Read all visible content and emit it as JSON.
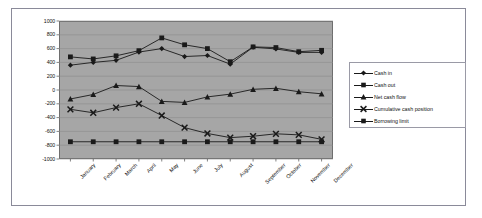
{
  "chart_data": {
    "type": "line",
    "title": "",
    "xlabel": "",
    "ylabel": "",
    "ylim": [
      -1000,
      1000
    ],
    "grid": true,
    "legend_position": "right",
    "plot_background": "#a6a6a6",
    "categories": [
      "January",
      "February",
      "March",
      "April",
      "May",
      "June",
      "July",
      "August",
      "September",
      "October",
      "November",
      "December"
    ],
    "yticks": [
      1000,
      800,
      600,
      400,
      200,
      0,
      -200,
      -400,
      -600,
      -800,
      -1000
    ],
    "series": [
      {
        "name": "Cash in",
        "marker": "diamond",
        "color": "#1a1a1a",
        "values": [
          360,
          400,
          430,
          550,
          600,
          485,
          500,
          375,
          620,
          595,
          545,
          545
        ]
      },
      {
        "name": "Cash out",
        "marker": "square",
        "color": "#1a1a1a",
        "values": [
          480,
          450,
          495,
          570,
          755,
          655,
          600,
          410,
          625,
          615,
          555,
          575
        ]
      },
      {
        "name": "Net cash flow",
        "marker": "triangle",
        "color": "#1a1a1a",
        "values": [
          -130,
          -65,
          65,
          50,
          -165,
          -180,
          -100,
          -60,
          10,
          25,
          -25,
          -55
        ]
      },
      {
        "name": "Cumulative cash position",
        "marker": "cross",
        "color": "#1a1a1a",
        "values": [
          -280,
          -330,
          -255,
          -200,
          -370,
          -545,
          -630,
          -690,
          -670,
          -635,
          -650,
          -715
        ]
      },
      {
        "name": "Borrowing limit",
        "marker": "square",
        "color": "#1a1a1a",
        "values": [
          -750,
          -750,
          -750,
          -750,
          -750,
          -750,
          -750,
          -750,
          -750,
          -750,
          -750,
          -750
        ]
      }
    ]
  }
}
